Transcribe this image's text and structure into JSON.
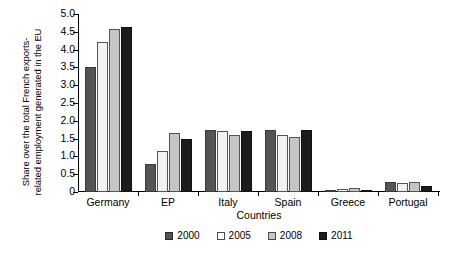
{
  "chart_data": {
    "type": "bar",
    "title": "",
    "xlabel": "Countries",
    "ylabel": "Share over the total French exports-related employment generated in the EU",
    "ylabel_lines": [
      "Share over the total French exports-",
      "related employment generated in the EU"
    ],
    "categories": [
      "Germany",
      "EP",
      "Italy",
      "Spain",
      "Greece",
      "Portugal"
    ],
    "series": [
      {
        "name": "2000",
        "color": "#545454",
        "values": [
          3.5,
          0.8,
          1.75,
          1.75,
          0.05,
          0.28
        ]
      },
      {
        "name": "2005",
        "color": "#f2f2f2",
        "values": [
          4.2,
          1.15,
          1.7,
          1.6,
          0.08,
          0.26
        ]
      },
      {
        "name": "2008",
        "color": "#c6c6c6",
        "values": [
          4.58,
          1.65,
          1.6,
          1.55,
          0.1,
          0.27
        ]
      },
      {
        "name": "2011",
        "color": "#1c1c1c",
        "values": [
          4.63,
          1.5,
          1.7,
          1.75,
          0.06,
          0.18
        ]
      }
    ],
    "ylim": [
      0,
      5.0
    ],
    "yticks": [
      0,
      0.5,
      1.0,
      1.5,
      2.0,
      2.5,
      3.0,
      3.5,
      4.0,
      4.5,
      5.0
    ],
    "ytick_labels": [
      "0",
      "0.5",
      "1.0",
      "1.5",
      "2.0",
      "2.5",
      "3.0",
      "3.5",
      "4.0",
      "4.5",
      "5.0"
    ],
    "grid": false,
    "legend_position": "bottom",
    "legend_entries": [
      "2000",
      "2005",
      "2008",
      "2011"
    ]
  }
}
